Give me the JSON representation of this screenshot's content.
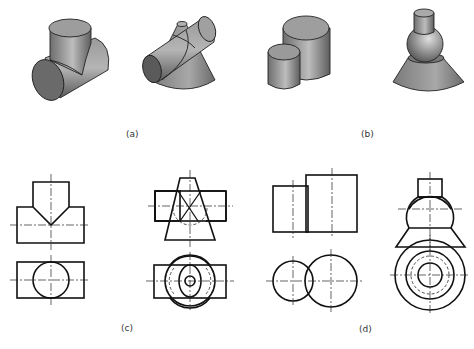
{
  "figure": {
    "labels": {
      "a": "(a)",
      "b": "(b)",
      "c": "(c)",
      "d": "(d)"
    },
    "iso_views": [
      {
        "id": "tee-cylinders",
        "group": "a",
        "description": "two equal cylinders intersecting at right angle"
      },
      {
        "id": "cylinder-through-cone",
        "group": "a",
        "description": "horizontal cylinder penetrating a cone"
      },
      {
        "id": "two-coaxial-adjacent-cylinders",
        "group": "b",
        "description": "two vertical cylinders side by side"
      },
      {
        "id": "cylinder-sphere-cone-stack",
        "group": "b",
        "description": "small cylinder on sphere on truncated cone"
      }
    ],
    "orthographic_views": [
      {
        "id": "tee-front-top",
        "group": "c"
      },
      {
        "id": "cone-cylinder-front-top",
        "group": "c"
      },
      {
        "id": "two-cylinders-front-top",
        "group": "d"
      },
      {
        "id": "sphere-stack-front-top",
        "group": "d"
      }
    ],
    "colors": {
      "line": "#111111",
      "shade_dark": "#5a5a5a",
      "shade_mid": "#8a8a8a",
      "shade_light": "#b8b8b8",
      "background": "#ffffff"
    }
  }
}
